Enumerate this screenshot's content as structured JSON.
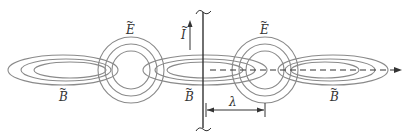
{
  "diagram": {
    "colors": {
      "field_lines": "#8a8a8a",
      "antenna": "#333333",
      "axis": "#333333",
      "text": "#333333"
    },
    "labels": {
      "current": "I",
      "electric_field_1": "E",
      "electric_field_2": "E",
      "magnetic_field_1": "B",
      "magnetic_field_2": "B",
      "magnetic_field_3": "B",
      "wavelength": "λ",
      "tilde": "~"
    },
    "elements": {
      "antenna": "vertical dipole antenna with wavy ends",
      "current_arrow": "upward arrow for current I",
      "e_loops": 2,
      "b_loops": 3,
      "propagation_axis": "dashed horizontal arrow pointing right",
      "wavelength_marker": "double-headed arrow spanning λ"
    }
  }
}
